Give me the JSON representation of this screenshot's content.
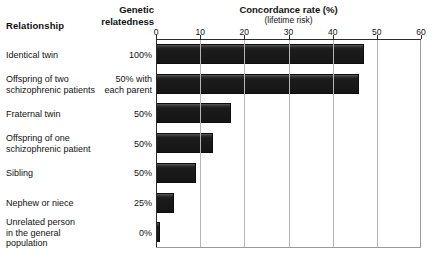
{
  "header": {
    "relationship_label": "Relationship",
    "genetic_label": "Genetic\nrelatedness",
    "genetic_label_line1": "Genetic",
    "genetic_label_line2": "relatedness"
  },
  "chart_data": {
    "type": "bar",
    "orientation": "horizontal",
    "title": "Concordance rate (%)",
    "subtitle": "(lifetime risk)",
    "xlabel": "",
    "ylabel": "",
    "xlim": [
      0,
      60
    ],
    "grid": true,
    "legend": "none",
    "tick_labels": [
      "0",
      "10",
      "20",
      "30",
      "40",
      "50",
      "60"
    ],
    "ticks": [
      0,
      10,
      20,
      30,
      40,
      50,
      60
    ],
    "categories": [
      "Identical twin",
      "Offspring of two schizophrenic patients",
      "Fraternal twin",
      "Offspring of one schizophrenic patient",
      "Sibling",
      "Nephew or niece",
      "Unrelated person in the general population"
    ],
    "values": [
      47,
      46,
      17,
      13,
      9,
      4,
      1
    ],
    "bar_color": "#1a1a1a"
  },
  "rows": [
    {
      "relationship_line1": "Identical twin",
      "relationship_line2": "",
      "genetic_line1": "100%",
      "genetic_line2": "",
      "value": 47
    },
    {
      "relationship_line1": "Offspring of two",
      "relationship_line2": "schizophrenic patients",
      "genetic_line1": "50% with",
      "genetic_line2": "each parent",
      "value": 46
    },
    {
      "relationship_line1": "Fraternal twin",
      "relationship_line2": "",
      "genetic_line1": "50%",
      "genetic_line2": "",
      "value": 17
    },
    {
      "relationship_line1": "Offspring of one",
      "relationship_line2": "schizophrenic patient",
      "genetic_line1": "50%",
      "genetic_line2": "",
      "value": 13
    },
    {
      "relationship_line1": "Sibling",
      "relationship_line2": "",
      "genetic_line1": "50%",
      "genetic_line2": "",
      "value": 9
    },
    {
      "relationship_line1": "Nephew or niece",
      "relationship_line2": "",
      "genetic_line1": "25%",
      "genetic_line2": "",
      "value": 4
    },
    {
      "relationship_line1": "Unrelated person",
      "relationship_line2": "in the general population",
      "genetic_line1": "0%",
      "genetic_line2": "",
      "value": 1
    }
  ]
}
